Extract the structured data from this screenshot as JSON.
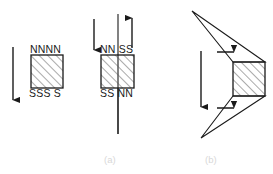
{
  "figure": {
    "background_color": "#ffffff",
    "stroke_color": "#1a1a1a",
    "hatch_color": "#555555",
    "caption_color": "#d8d8d8",
    "panels": [
      {
        "id": "panel-a",
        "caption": "(a)",
        "caption_x": 104,
        "caption_y": 154,
        "subfigures": [
          {
            "id": "magnet-left",
            "block": {
              "x": 31,
              "y": 55,
              "w": 32,
              "h": 33
            },
            "labels": {
              "top": "NNNN",
              "top_x": 30,
              "top_y": 44,
              "bottom": "SSS S",
              "bottom_x": 29,
              "bottom_y": 88
            },
            "arrows": [
              {
                "name": "field-arrow-down",
                "x1": 13,
                "y1": 47,
                "x2": 13,
                "y2": 101,
                "direction": "down"
              }
            ],
            "center_line": null
          },
          {
            "id": "magnet-middle",
            "block": {
              "x": 101,
              "y": 55,
              "w": 33,
              "h": 33
            },
            "labels": {
              "top": "NN SS",
              "top_x": 100,
              "top_y": 44,
              "bottom": "SS NN",
              "bottom_x": 100,
              "bottom_y": 88
            },
            "arrows": [
              {
                "name": "field-arrow-down",
                "x1": 94,
                "y1": 19,
                "x2": 94,
                "y2": 51,
                "direction": "down"
              },
              {
                "name": "field-arrow-up",
                "x1": 132,
                "y1": 48,
                "x2": 132,
                "y2": 17,
                "direction": "up"
              }
            ],
            "center_line": {
              "x": 118,
              "y1": 14,
              "y2": 134
            }
          }
        ]
      },
      {
        "id": "panel-b",
        "caption": "(b)",
        "caption_x": 205,
        "caption_y": 154,
        "subfigures": [
          {
            "id": "magnet-right",
            "block": {
              "x": 233,
              "y": 62,
              "w": 32,
              "h": 34
            },
            "labels": null,
            "wedges": [
              {
                "name": "upper-wedge",
                "points": "192,11 233,62 265,62"
              },
              {
                "name": "lower-wedge",
                "points": "201,138 233,96 265,96"
              }
            ],
            "arrows": [
              {
                "name": "flux-arrow-right-upper",
                "x1": 216,
                "y1": 52,
                "x2": 235,
                "y2": 52,
                "direction": "right"
              },
              {
                "name": "flux-arrow-right-lower",
                "x1": 216,
                "y1": 108,
                "x2": 235,
                "y2": 108,
                "direction": "right"
              },
              {
                "name": "field-arrow-down",
                "x1": 201,
                "y1": 51,
                "x2": 201,
                "y2": 108,
                "direction": "down"
              }
            ],
            "center_line": null
          }
        ]
      }
    ]
  }
}
